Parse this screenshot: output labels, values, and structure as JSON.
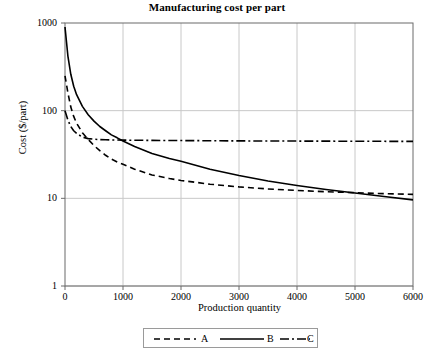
{
  "chart_data": {
    "type": "line",
    "title": "Manufacturing cost per part",
    "xlabel": "Production quantity",
    "ylabel": "Cost ($/part)",
    "xlim": [
      0,
      6000
    ],
    "ylim": [
      1,
      1000
    ],
    "yscale": "log",
    "xscale": "linear",
    "grid": true,
    "legend_position": "below-axis",
    "xticks": [
      "0",
      "1000",
      "2000",
      "3000",
      "4000",
      "5000",
      "6000"
    ],
    "xtick_values": [
      0,
      1000,
      2000,
      3000,
      4000,
      5000,
      6000
    ],
    "yticks": [
      "1",
      "10",
      "100",
      "1000"
    ],
    "ytick_values": [
      1,
      10,
      100,
      1000
    ],
    "x": [
      0,
      50,
      100,
      150,
      200,
      300,
      400,
      500,
      600,
      700,
      800,
      900,
      1000,
      1200,
      1500,
      1800,
      2000,
      2500,
      3000,
      3500,
      4000,
      4500,
      5000,
      5500,
      6000
    ],
    "series": [
      {
        "name": "A",
        "style": "dashed",
        "color": "#000000",
        "values": [
          250,
          160,
          110,
          86,
          72,
          56,
          47,
          40,
          35,
          31,
          28,
          26,
          24.5,
          21.5,
          18.5,
          16.8,
          16.0,
          14.5,
          13.5,
          12.8,
          12.3,
          11.9,
          11.6,
          11.3,
          11.1
        ]
      },
      {
        "name": "B",
        "style": "solid",
        "color": "#000000",
        "values": [
          900,
          420,
          260,
          190,
          152,
          112,
          90,
          76,
          66,
          59,
          53,
          49,
          45,
          39,
          32.5,
          28.5,
          26.5,
          21.5,
          18.2,
          15.8,
          14.0,
          12.6,
          11.5,
          10.5,
          9.6
        ]
      },
      {
        "name": "C",
        "style": "dash-dot",
        "color": "#000000",
        "values": [
          100,
          78,
          66,
          59,
          55,
          50,
          48,
          47.2,
          46.8,
          46.5,
          46.3,
          46.2,
          46.1,
          46.0,
          45.8,
          45.7,
          45.6,
          45.4,
          45.2,
          45.1,
          45.0,
          44.9,
          44.8,
          44.7,
          44.6
        ]
      }
    ],
    "legend_entries": [
      {
        "label": "A",
        "style": "dashed"
      },
      {
        "label": "B",
        "style": "solid"
      },
      {
        "label": "C",
        "style": "dash-dot"
      }
    ],
    "colors": {
      "background": "#ffffff",
      "frame": "#6b6b6b",
      "gridline": "#c8c8c8",
      "line": "#000000",
      "legend_border": "#9a9a9a"
    }
  }
}
